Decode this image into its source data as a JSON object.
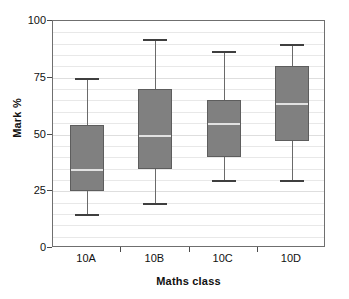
{
  "chart_data": {
    "type": "box",
    "title": "",
    "xlabel": "Maths class",
    "ylabel": "Mark %",
    "categories": [
      "10A",
      "10B",
      "10C",
      "10D"
    ],
    "ylim": [
      0,
      100
    ],
    "yticks": [
      0,
      25,
      50,
      75,
      100
    ],
    "ytick_labels": [
      "0",
      "25",
      "50",
      "75",
      "100"
    ],
    "minor_gridline_step": 5,
    "grid": true,
    "legend": "none",
    "box_fill_color": "#808080",
    "box_edge_color": "#5d5d5d",
    "median_color": "#e2e2e2",
    "whisker_color": "#6a6a6a",
    "boxes": [
      {
        "category": "10A",
        "min": 15,
        "q1": 25,
        "median": 35,
        "q3": 54,
        "max": 75
      },
      {
        "category": "10B",
        "min": 20,
        "q1": 35,
        "median": 50,
        "q3": 70,
        "max": 92
      },
      {
        "category": "10C",
        "min": 30,
        "q1": 40,
        "median": 55,
        "q3": 65,
        "max": 87
      },
      {
        "category": "10D",
        "min": 30,
        "q1": 47,
        "median": 64,
        "q3": 80,
        "max": 90
      }
    ]
  }
}
